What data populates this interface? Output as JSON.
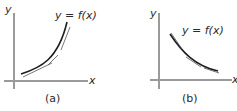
{
  "panels": [
    {
      "id": "a",
      "caption": "(a)",
      "function_label": "y = f(x)",
      "x_axis_label": "x",
      "y_axis_label": "y",
      "description": "increasing concave-up curve with tangent lines lying below the curve"
    },
    {
      "id": "b",
      "caption": "(b)",
      "function_label": "y = f(x)",
      "x_axis_label": "x",
      "y_axis_label": "y",
      "description": "decreasing concave-up curve with tangent lines lying below the curve"
    }
  ],
  "colors": {
    "axis": "#9a9a9a",
    "curve": "#1e1e1e",
    "tangent": "#555555",
    "text": "#2a2a2a"
  }
}
